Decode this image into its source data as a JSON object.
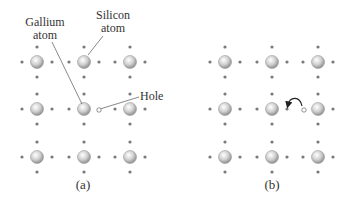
{
  "panel_a": {
    "caption": "(a)",
    "labels": {
      "gallium": [
        "Gallium",
        "atom"
      ],
      "silicon": [
        "Silicon",
        "atom"
      ],
      "hole": "Hole"
    },
    "atom_columns_x": [
      37,
      84,
      130
    ],
    "atom_rows_y": [
      62,
      109,
      157
    ]
  },
  "panel_b": {
    "caption": "(b)",
    "atom_columns_x": [
      225,
      272,
      318
    ],
    "atom_rows_y": [
      62,
      109,
      157
    ],
    "arrow": "curved-arrow electron moves into hole"
  },
  "colors": {
    "atom_fill": "#c8c8c8",
    "atom_stroke": "#9a9a9a",
    "electron": "#7a7a7a",
    "line": "#555555",
    "text": "#333333"
  }
}
